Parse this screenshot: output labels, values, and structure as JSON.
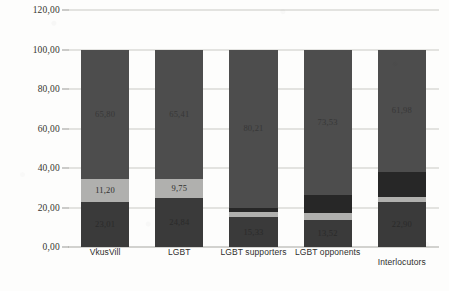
{
  "chart_data": {
    "type": "bar",
    "stacked": true,
    "title": "",
    "subtitle": "",
    "xlabel": "",
    "ylabel": "",
    "ylim": [
      0,
      120
    ],
    "ytick_labels": [
      "0,00",
      "20,00",
      "40,00",
      "60,00",
      "80,00",
      "100,00",
      "120,00"
    ],
    "ytick_values": [
      0,
      20,
      40,
      60,
      80,
      100,
      120
    ],
    "grid": true,
    "legend": "none",
    "decimal_separator": ",",
    "categories": [
      "VkusVill",
      "LGBT",
      "LGBT supporters",
      "LGBT opponents",
      "Interlocutors"
    ],
    "series": [
      {
        "name": "bottom",
        "color": "#3a3a3a",
        "values": [
          23.01,
          24.84,
          15.33,
          13.52,
          22.9
        ],
        "labels": [
          "23,01",
          "24,84",
          "15,33",
          "13,52",
          "22,90"
        ]
      },
      {
        "name": "middle",
        "color": "#b0b0ae",
        "values": [
          11.2,
          9.75,
          2.2,
          3.8,
          2.3
        ],
        "labels": [
          "11,20",
          "9,75",
          "2,20",
          "3,80",
          "2,30"
        ]
      },
      {
        "name": "upper-middle",
        "color": "#272727",
        "values": [
          0.0,
          0.0,
          2.26,
          9.15,
          12.82
        ],
        "labels": [
          "",
          "",
          "",
          "",
          ""
        ]
      },
      {
        "name": "top",
        "color": "#4d4d4d",
        "values": [
          65.8,
          65.41,
          80.21,
          73.53,
          61.98
        ],
        "labels": [
          "65,80",
          "65,41",
          "80,21",
          "73,53",
          "61,98"
        ]
      }
    ],
    "totals": [
      100.0,
      100.0,
      100.0,
      100.0,
      100.0
    ]
  },
  "colors": {
    "bar_top": "#4d4d4d",
    "bar_upper_middle": "#272727",
    "bar_middle": "#b0b0ae",
    "bar_bottom": "#3a3a3a",
    "gridline": "#c9c9c4",
    "background": "#fdfdfc",
    "text": "#2e2e2c"
  }
}
